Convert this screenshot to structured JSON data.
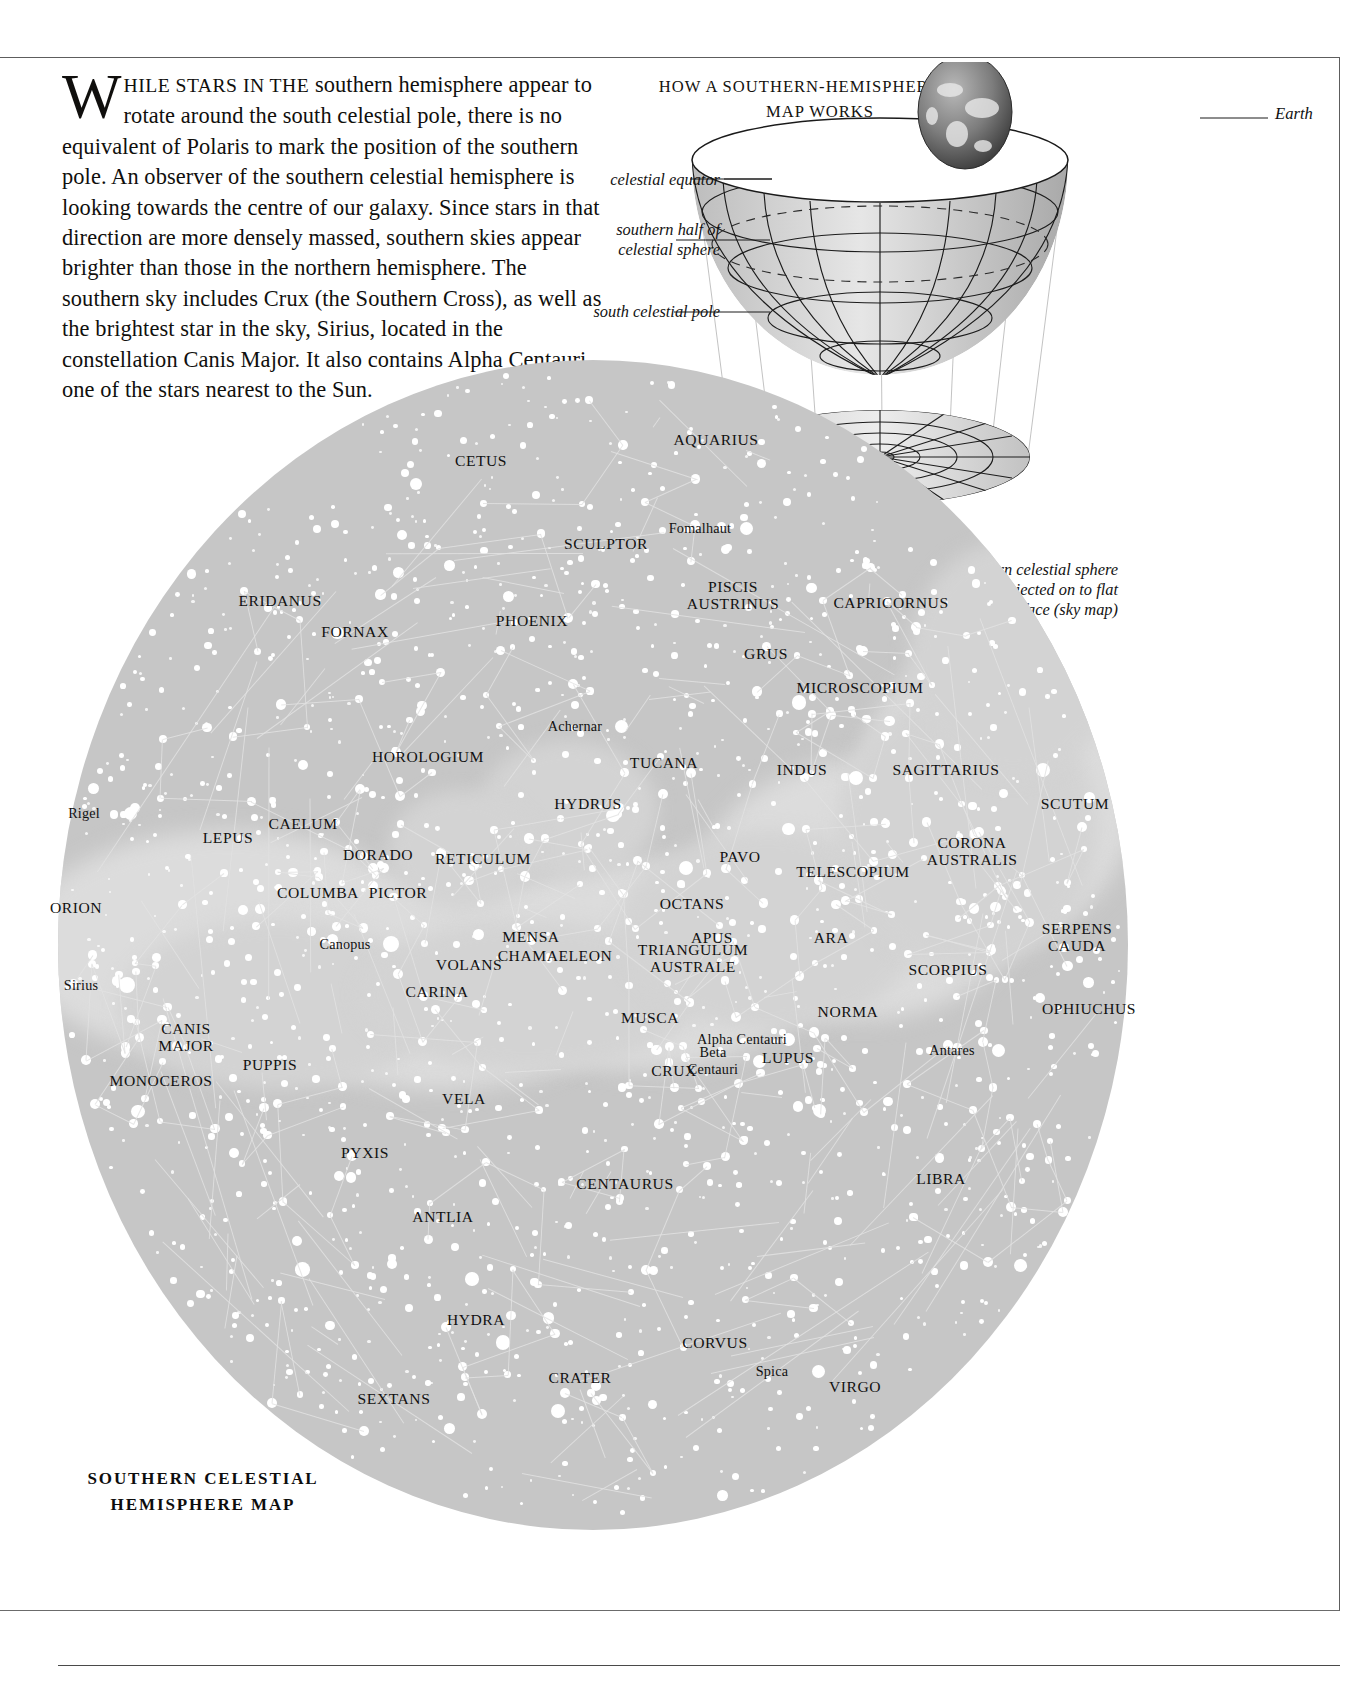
{
  "intro": {
    "dropcap": "W",
    "lead": "HILE STARS IN THE",
    "body": " southern hemisphere appear to rotate around the south celestial pole, there is no equivalent of Polaris to mark the position of the southern pole. An observer of the southern celestial hemisphere is looking towards the centre of our galaxy. Since stars in that direction are more densely massed, southern skies appear brighter than those in the northern hemisphere. The southern sky includes Crux (the Southern Cross), as well as the brightest star in the sky, Sirius, located in the constellation Canis Major. It also contains Alpha Centauri, one of the stars nearest to the Sun."
  },
  "diagram": {
    "title": "HOW A SOUTHERN-HEMISPHERE\nSKY MAP WORKS",
    "earth_label": "Earth",
    "celestial_equator_label": "celestial equator",
    "southern_half_label": "southern half of\ncelestial sphere",
    "south_pole_label": "south celestial pole",
    "projection_label": "southern celestial sphere\nis projected on to flat\nsurface (sky map)"
  },
  "map_title": "SOUTHERN\nCELESTIAL\nHEMISPHERE MAP",
  "colors": {
    "sky_disc": "#c6c6c6",
    "milky_way": "#d8d8d8",
    "star": "#ffffff",
    "constellation_line": "#e2e2e2",
    "label_text": "#111111",
    "frame": "#5d5d5d"
  },
  "chart_data": {
    "type": "scatter",
    "title": "SOUTHERN CELESTIAL HEMISPHERE MAP",
    "projection": "polar azimuthal (south celestial pole at centre)",
    "constellations": [
      {
        "name": "AQUARIUS",
        "x": 716,
        "y": 439
      },
      {
        "name": "CETUS",
        "x": 481,
        "y": 460
      },
      {
        "name": "SCULPTOR",
        "x": 606,
        "y": 543
      },
      {
        "name": "PISCIS\nAUSTRINUS",
        "x": 733,
        "y": 595
      },
      {
        "name": "CAPRICORNUS",
        "x": 891,
        "y": 602
      },
      {
        "name": "ERIDANUS",
        "x": 280,
        "y": 600
      },
      {
        "name": "PHOENIX",
        "x": 532,
        "y": 620
      },
      {
        "name": "FORNAX",
        "x": 355,
        "y": 631
      },
      {
        "name": "GRUS",
        "x": 766,
        "y": 653
      },
      {
        "name": "MICROSCOPIUM",
        "x": 860,
        "y": 687
      },
      {
        "name": "HOROLOGIUM",
        "x": 428,
        "y": 756
      },
      {
        "name": "TUCANA",
        "x": 664,
        "y": 762
      },
      {
        "name": "INDUS",
        "x": 802,
        "y": 769
      },
      {
        "name": "SAGITTARIUS",
        "x": 946,
        "y": 769
      },
      {
        "name": "HYDRUS",
        "x": 588,
        "y": 803
      },
      {
        "name": "SCUTUM",
        "x": 1075,
        "y": 803
      },
      {
        "name": "CAELUM",
        "x": 303,
        "y": 823
      },
      {
        "name": "LEPUS",
        "x": 228,
        "y": 837
      },
      {
        "name": "CORONA\nAUSTRALIS",
        "x": 972,
        "y": 851
      },
      {
        "name": "DORADO",
        "x": 378,
        "y": 854
      },
      {
        "name": "PAVO",
        "x": 740,
        "y": 856
      },
      {
        "name": "RETICULUM",
        "x": 483,
        "y": 858
      },
      {
        "name": "TELESCOPIUM",
        "x": 853,
        "y": 871
      },
      {
        "name": "COLUMBA",
        "x": 318,
        "y": 892
      },
      {
        "name": "PICTOR",
        "x": 398,
        "y": 892
      },
      {
        "name": "ORION",
        "x": 76,
        "y": 907
      },
      {
        "name": "OCTANS",
        "x": 692,
        "y": 903
      },
      {
        "name": "SERPENS\nCAUDA",
        "x": 1077,
        "y": 937
      },
      {
        "name": "MENSA",
        "x": 531,
        "y": 936
      },
      {
        "name": "APUS",
        "x": 712,
        "y": 937
      },
      {
        "name": "ARA",
        "x": 831,
        "y": 937
      },
      {
        "name": "CHAMAELEON",
        "x": 555,
        "y": 955
      },
      {
        "name": "TRIANGULUM\nAUSTRALE",
        "x": 693,
        "y": 958
      },
      {
        "name": "VOLANS",
        "x": 469,
        "y": 964
      },
      {
        "name": "SCORPIUS",
        "x": 948,
        "y": 969
      },
      {
        "name": "CARINA",
        "x": 437,
        "y": 991
      },
      {
        "name": "OPHIUCHUS",
        "x": 1089,
        "y": 1008
      },
      {
        "name": "MUSCA",
        "x": 650,
        "y": 1017
      },
      {
        "name": "NORMA",
        "x": 848,
        "y": 1011
      },
      {
        "name": "CANIS\nMAJOR",
        "x": 186,
        "y": 1037
      },
      {
        "name": "LUPUS",
        "x": 788,
        "y": 1057
      },
      {
        "name": "CRUX",
        "x": 674,
        "y": 1070
      },
      {
        "name": "PUPPIS",
        "x": 270,
        "y": 1064
      },
      {
        "name": "MONOCEROS",
        "x": 161,
        "y": 1080
      },
      {
        "name": "VELA",
        "x": 464,
        "y": 1098
      },
      {
        "name": "PYXIS",
        "x": 365,
        "y": 1152
      },
      {
        "name": "LIBRA",
        "x": 941,
        "y": 1178
      },
      {
        "name": "CENTAURUS",
        "x": 625,
        "y": 1183
      },
      {
        "name": "ANTLIA",
        "x": 443,
        "y": 1216
      },
      {
        "name": "HYDRA",
        "x": 476,
        "y": 1319
      },
      {
        "name": "CORVUS",
        "x": 715,
        "y": 1342
      },
      {
        "name": "CRATER",
        "x": 580,
        "y": 1377
      },
      {
        "name": "SEXTANS",
        "x": 394,
        "y": 1398
      },
      {
        "name": "VIRGO",
        "x": 855,
        "y": 1386
      }
    ],
    "named_stars": [
      {
        "name": "Fomalhaut",
        "x": 700,
        "y": 528
      },
      {
        "name": "Achernar",
        "x": 575,
        "y": 726
      },
      {
        "name": "Rigel",
        "x": 84,
        "y": 813
      },
      {
        "name": "Canopus",
        "x": 345,
        "y": 944
      },
      {
        "name": "Sirius",
        "x": 81,
        "y": 985
      },
      {
        "name": "Alpha Centauri",
        "x": 742,
        "y": 1039
      },
      {
        "name": "Antares",
        "x": 952,
        "y": 1050
      },
      {
        "name": "Beta\nCentauri",
        "x": 713,
        "y": 1061
      },
      {
        "name": "Spica",
        "x": 772,
        "y": 1371
      }
    ]
  }
}
